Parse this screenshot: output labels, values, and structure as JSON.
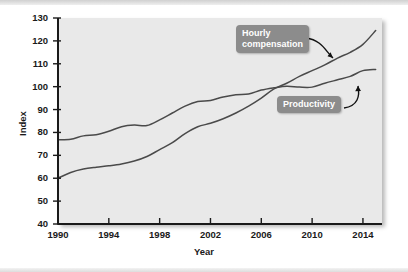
{
  "chart_data": {
    "type": "line",
    "title": "",
    "xlabel": "Year",
    "ylabel": "Index",
    "xlim": [
      1990,
      2015.5
    ],
    "ylim": [
      40,
      130
    ],
    "xticks": [
      1990,
      1994,
      1998,
      2002,
      2006,
      2010,
      2014
    ],
    "yticks": [
      40,
      50,
      60,
      70,
      80,
      90,
      100,
      110,
      120,
      130
    ],
    "grid": false,
    "legend": "annotated-callouts",
    "x": [
      1990,
      1991,
      1992,
      1993,
      1994,
      1995,
      1996,
      1997,
      1998,
      1999,
      2000,
      2001,
      2002,
      2003,
      2004,
      2005,
      2006,
      2007,
      2008,
      2009,
      2010,
      2011,
      2012,
      2013,
      2014,
      2015
    ],
    "series": [
      {
        "name": "Hourly compensation",
        "values": [
          60,
          62.5,
          64,
          64.8,
          65.4,
          66.2,
          67.5,
          69.5,
          72.5,
          75.5,
          79.5,
          82.5,
          84,
          86,
          88.5,
          91.5,
          95,
          99,
          101.5,
          104.5,
          107,
          109.5,
          112.5,
          115,
          118.5,
          124.5
        ],
        "color": "#4a4a4a"
      },
      {
        "name": "Productivity",
        "values": [
          76.8,
          77,
          78.5,
          79,
          80.5,
          82.5,
          83.2,
          83,
          85.5,
          88.5,
          91.5,
          93.5,
          94,
          95.5,
          96.5,
          96.8,
          98.5,
          99.5,
          100.2,
          99.8,
          99.8,
          101.5,
          103,
          104.5,
          107,
          107.5
        ],
        "color": "#4a4a4a"
      }
    ],
    "annotations": [
      {
        "label": "Hourly\ncompensation",
        "points_to_year": 2013,
        "points_to_value": 119
      },
      {
        "label": "Productivity",
        "points_to_year": 2014.3,
        "points_to_value": 107
      }
    ]
  },
  "axis": {
    "ylabel": "Index",
    "xlabel": "Year",
    "ytick_labels": [
      "130",
      "120",
      "110",
      "100",
      "90",
      "80",
      "70",
      "60",
      "50",
      "40"
    ],
    "xtick_labels": [
      "1990",
      "1994",
      "1998",
      "2002",
      "2006",
      "2010",
      "2014"
    ]
  },
  "callouts": {
    "hourly": "Hourly\ncompensation",
    "productivity": "Productivity"
  },
  "colors": {
    "panel_bg": "#e9e9e9",
    "line": "#4a4a4a",
    "callout_bg": "#8c8c8c",
    "callout_text": "#ffffff",
    "axis": "#1a1a1a"
  }
}
